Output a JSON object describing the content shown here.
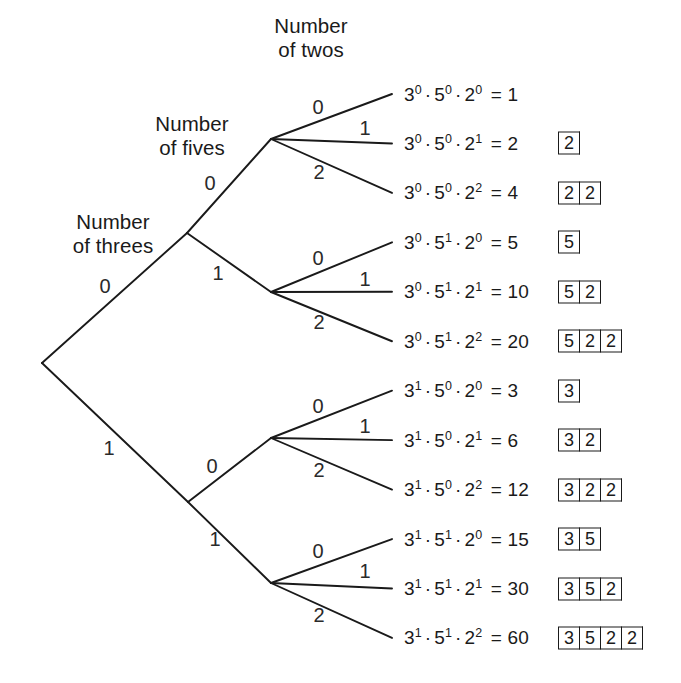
{
  "figure": {
    "type": "probability-tree-diagram",
    "width": 681,
    "height": 683,
    "background": "#ffffff",
    "line_color": "#1a1a1a",
    "text_color": "#1a1a1a"
  },
  "headers": [
    {
      "text": "Number\nof threes",
      "x": 113,
      "y": 210
    },
    {
      "text": "Number\nof fives",
      "x": 192,
      "y": 112
    },
    {
      "text": "Number\nof twos",
      "x": 311,
      "y": 14
    }
  ],
  "nodes": {
    "root": {
      "x": 42,
      "y": 363
    },
    "level1": [
      {
        "x": 187,
        "y": 233
      },
      {
        "x": 188,
        "y": 502
      }
    ],
    "level2": [
      {
        "x": 271,
        "y": 139
      },
      {
        "x": 271,
        "y": 292
      },
      {
        "x": 271,
        "y": 438
      },
      {
        "x": 271,
        "y": 583
      }
    ],
    "leaf_x": 404
  },
  "edges": {
    "root_to_level1": [
      {
        "from": "root",
        "to": "level1.0",
        "label": "0",
        "lx": 105,
        "ly": 286
      },
      {
        "from": "root",
        "to": "level1.1",
        "label": "1",
        "lx": 109,
        "ly": 448
      }
    ],
    "level1_to_level2": [
      {
        "from": "level1.0",
        "to": "level2.0",
        "label": "0",
        "lx": 210,
        "ly": 183
      },
      {
        "from": "level1.0",
        "to": "level2.1",
        "label": "1",
        "lx": 218,
        "ly": 273
      },
      {
        "from": "level1.1",
        "to": "level2.2",
        "label": "0",
        "lx": 212,
        "ly": 466
      },
      {
        "from": "level1.1",
        "to": "level2.3",
        "label": "1",
        "lx": 215,
        "ly": 539
      }
    ],
    "level2_to_leaf": [
      {
        "from": "level2.0",
        "leaf": 0,
        "label": "0",
        "lx": 318,
        "ly": 107
      },
      {
        "from": "level2.0",
        "leaf": 1,
        "label": "1",
        "lx": 365,
        "ly": 128
      },
      {
        "from": "level2.0",
        "leaf": 2,
        "label": "2",
        "lx": 319,
        "ly": 172
      },
      {
        "from": "level2.1",
        "leaf": 3,
        "label": "0",
        "lx": 318,
        "ly": 258
      },
      {
        "from": "level2.1",
        "leaf": 4,
        "label": "1",
        "lx": 365,
        "ly": 279
      },
      {
        "from": "level2.1",
        "leaf": 5,
        "label": "2",
        "lx": 319,
        "ly": 322
      },
      {
        "from": "level2.2",
        "leaf": 6,
        "label": "0",
        "lx": 318,
        "ly": 406
      },
      {
        "from": "level2.2",
        "leaf": 7,
        "label": "1",
        "lx": 365,
        "ly": 426
      },
      {
        "from": "level2.2",
        "leaf": 8,
        "label": "2",
        "lx": 319,
        "ly": 470
      },
      {
        "from": "level2.3",
        "leaf": 9,
        "label": "0",
        "lx": 318,
        "ly": 551
      },
      {
        "from": "level2.3",
        "leaf": 10,
        "label": "1",
        "lx": 365,
        "ly": 571
      },
      {
        "from": "level2.3",
        "leaf": 11,
        "label": "2",
        "lx": 319,
        "ly": 615
      }
    ]
  },
  "leaf_geometry": {
    "first_y": 94,
    "spacing": 49.45,
    "expr_x": 404,
    "boxes_x": 558,
    "box_width": 21,
    "box_height": 23
  },
  "leaves": [
    {
      "base3": "3",
      "exp3": "0",
      "base5": "5",
      "exp5": "0",
      "base2": "2",
      "exp2": "0",
      "product": "1",
      "boxes": []
    },
    {
      "base3": "3",
      "exp3": "0",
      "base5": "5",
      "exp5": "0",
      "base2": "2",
      "exp2": "1",
      "product": "2",
      "boxes": [
        "2"
      ]
    },
    {
      "base3": "3",
      "exp3": "0",
      "base5": "5",
      "exp5": "0",
      "base2": "2",
      "exp2": "2",
      "product": "4",
      "boxes": [
        "2",
        "2"
      ]
    },
    {
      "base3": "3",
      "exp3": "0",
      "base5": "5",
      "exp5": "1",
      "base2": "2",
      "exp2": "0",
      "product": "5",
      "boxes": [
        "5"
      ]
    },
    {
      "base3": "3",
      "exp3": "0",
      "base5": "5",
      "exp5": "1",
      "base2": "2",
      "exp2": "1",
      "product": "10",
      "boxes": [
        "5",
        "2"
      ]
    },
    {
      "base3": "3",
      "exp3": "0",
      "base5": "5",
      "exp5": "1",
      "base2": "2",
      "exp2": "2",
      "product": "20",
      "boxes": [
        "5",
        "2",
        "2"
      ]
    },
    {
      "base3": "3",
      "exp3": "1",
      "base5": "5",
      "exp5": "0",
      "base2": "2",
      "exp2": "0",
      "product": "3",
      "boxes": [
        "3"
      ]
    },
    {
      "base3": "3",
      "exp3": "1",
      "base5": "5",
      "exp5": "0",
      "base2": "2",
      "exp2": "1",
      "product": "6",
      "boxes": [
        "3",
        "2"
      ]
    },
    {
      "base3": "3",
      "exp3": "1",
      "base5": "5",
      "exp5": "0",
      "base2": "2",
      "exp2": "2",
      "product": "12",
      "boxes": [
        "3",
        "2",
        "2"
      ]
    },
    {
      "base3": "3",
      "exp3": "1",
      "base5": "5",
      "exp5": "1",
      "base2": "2",
      "exp2": "0",
      "product": "15",
      "boxes": [
        "3",
        "5"
      ]
    },
    {
      "base3": "3",
      "exp3": "1",
      "base5": "5",
      "exp5": "1",
      "base2": "2",
      "exp2": "1",
      "product": "30",
      "boxes": [
        "3",
        "5",
        "2"
      ]
    },
    {
      "base3": "3",
      "exp3": "1",
      "base5": "5",
      "exp5": "1",
      "base2": "2",
      "exp2": "2",
      "product": "60",
      "boxes": [
        "3",
        "5",
        "2",
        "2"
      ]
    }
  ],
  "symbols": {
    "multiply_dot": "·",
    "equals": "="
  }
}
